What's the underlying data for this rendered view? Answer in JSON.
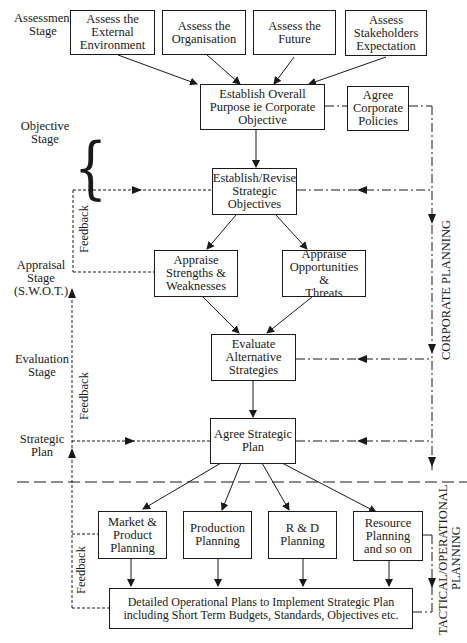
{
  "stages": {
    "assessment": "Assessment\nStage",
    "objective": "Objective\nStage",
    "appraisal": "Appraisal\nStage\n(S.W.O.T.)",
    "evaluation": "Evaluation\nStage",
    "strategic_plan": "Strategic\nPlan"
  },
  "boxes": {
    "external_env": "Assess the\nExternal\nEnvironment",
    "organisation": "Assess the\nOrganisation",
    "future": "Assess the\nFuture",
    "stakeholders": "Assess\nStakeholders\nExpectation",
    "overall_purpose": "Establish Overall\nPurpose ie Corporate\nObjective",
    "corporate_policies": "Agree\nCorporate\nPolicies",
    "strategic_objectives": "Establish/Revise\nStrategic\nObjectives",
    "strengths": "Appraise\nStrengths &\nWeaknesses",
    "opportunities": "Appraise\nOpportunities &\nThreats",
    "evaluate": "Evaluate\nAlternative\nStrategies",
    "agree_plan": "Agree Strategic\nPlan",
    "market": "Market &\nProduct\nPlanning",
    "production": "Production\nPlanning",
    "rd": "R & D\nPlanning",
    "resource": "Resource\nPlanning\nand so on",
    "operational": "Detailed Operational Plans to Implement Strategic Plan\nincluding Short Term Budgets, Standards, Objectives etc."
  },
  "side_labels": {
    "feedback": "Feedback",
    "corporate_planning": "CORPORATE PLANNING",
    "tactical_line1": "TACTICAL/OPERATIONAL",
    "tactical_line2": "PLANNING"
  },
  "brace_glyph": "{"
}
